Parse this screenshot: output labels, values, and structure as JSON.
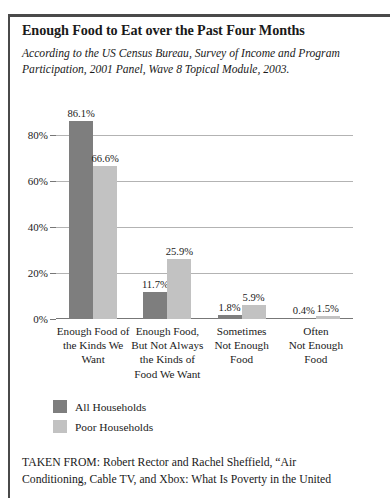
{
  "figure": {
    "title": "Enough Food to Eat over the Past Four Months",
    "subtitle": "According to the US Census Bureau, Survey of Income and Program Participation, 2001 Panel, Wave 8 Topical Module, 2003.",
    "source_line_1": "TAKEN FROM: Robert Rector and Rachel Sheffield, “Air",
    "source_line_2": "Conditioning, Cable TV, and Xbox: What Is Poverty in the United"
  },
  "colors": {
    "all_households": "#7e7e7e",
    "poor_households": "#c2c2c2",
    "gridline": "#b3b3b3",
    "axis": "#777777",
    "frame": "#4a4a4a",
    "text": "#1a1a1a"
  },
  "chart_data": {
    "type": "bar",
    "title": "Enough Food to Eat over the Past Four Months",
    "subtitle": "According to the US Census Bureau, Survey of Income and Program Participation, 2001 Panel, Wave 8 Topical Module, 2003.",
    "xlabel": "",
    "ylabel": "",
    "ylim": [
      0,
      90
    ],
    "grid": true,
    "legend_position": "bottom-left",
    "yticks": [
      0,
      20,
      40,
      60,
      80
    ],
    "ytick_labels": [
      "0%",
      "20%",
      "40%",
      "60%",
      "80%"
    ],
    "categories": [
      "Enough Food of the Kinds We Want",
      "Enough Food, But Not Always the Kinds of Food We Want",
      "Sometimes Not Enough Food",
      "Often Not Enough Food"
    ],
    "category_lines": [
      [
        "Enough Food of",
        "the Kinds We",
        "Want"
      ],
      [
        "Enough Food,",
        "But Not Always",
        "the Kinds of",
        "Food We Want"
      ],
      [
        "Sometimes",
        "Not Enough",
        "Food"
      ],
      [
        "Often",
        "Not Enough",
        "Food"
      ]
    ],
    "series": [
      {
        "name": "All Households",
        "color": "#7e7e7e",
        "values": [
          86.1,
          11.7,
          1.8,
          0.4
        ],
        "labels": [
          "86.1%",
          "11.7%",
          "1.8%",
          "0.4%"
        ]
      },
      {
        "name": "Poor Households",
        "color": "#c2c2c2",
        "values": [
          66.6,
          25.9,
          5.9,
          1.5
        ],
        "labels": [
          "66.6%",
          "25.9%",
          "5.9%",
          "1.5%"
        ]
      }
    ]
  }
}
